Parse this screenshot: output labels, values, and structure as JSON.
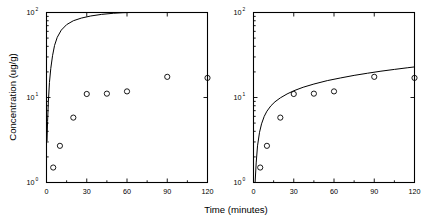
{
  "figure": {
    "background_color": "#ffffff",
    "ink_color": "#000000",
    "xlabel": "Time (minutes)",
    "ylabel": "Concentration (ug/g)"
  },
  "axes": {
    "x_ticks": [
      "0",
      "30",
      "60",
      "90",
      "120"
    ],
    "x_tick_values": [
      0,
      30,
      60,
      90,
      120
    ],
    "x_minor_values": [
      15,
      45,
      75,
      105
    ],
    "y_ticks": [
      "10",
      "10",
      "10"
    ],
    "y_tick_exponents": [
      "0",
      "1",
      "2"
    ],
    "y_tick_values": [
      1,
      10,
      100
    ],
    "xlim": [
      0,
      120
    ],
    "ylim": [
      1,
      100
    ],
    "yscale": "log",
    "xscale": "linear",
    "grid": false
  },
  "chart_data": [
    {
      "type": "scatter",
      "panel": "left",
      "title": "",
      "xlabel": "Time (minutes)",
      "ylabel": "Concentration (ug/g)",
      "xlim": [
        0,
        120
      ],
      "ylim": [
        1,
        100
      ],
      "yscale": "log",
      "grid": false,
      "legend": "none",
      "marker": "open-circle",
      "x": [
        5,
        10,
        20,
        30,
        45,
        60,
        90,
        120
      ],
      "y": [
        1.5,
        2.7,
        5.8,
        11.0,
        11.1,
        11.8,
        17.5,
        17.0
      ],
      "series": [
        {
          "name": "measured",
          "kind": "scatter",
          "x": [
            5,
            10,
            20,
            30,
            45,
            60,
            90,
            120
          ],
          "values": [
            1.5,
            2.7,
            5.8,
            11.0,
            11.1,
            11.8,
            17.5,
            17.0
          ]
        },
        {
          "name": "model-fit",
          "kind": "line",
          "note": "steep rise saturating at upper axis limit",
          "x": [
            0.4,
            0.8,
            1.4,
            2.2,
            3.2,
            4.5,
            6,
            8,
            11,
            15,
            20,
            26,
            33,
            41,
            50,
            57,
            62,
            70,
            85,
            100,
            120
          ],
          "values": [
            3.1,
            5.2,
            9.0,
            15.0,
            22.0,
            31.0,
            41.0,
            51.0,
            62.0,
            72.0,
            80.0,
            86.0,
            91.0,
            95.0,
            98.0,
            99.5,
            100.0,
            100.0,
            100.0,
            100.0,
            100.0
          ]
        }
      ]
    },
    {
      "type": "scatter",
      "panel": "right",
      "title": "",
      "xlabel": "Time (minutes)",
      "ylabel": "Concentration (ug/g)",
      "xlim": [
        0,
        120
      ],
      "ylim": [
        1,
        100
      ],
      "yscale": "log",
      "grid": false,
      "legend": "none",
      "marker": "open-circle",
      "x": [
        5,
        10,
        20,
        30,
        45,
        60,
        90,
        120
      ],
      "y": [
        1.5,
        2.7,
        5.8,
        11.0,
        11.1,
        11.8,
        17.5,
        17.0
      ],
      "series": [
        {
          "name": "measured",
          "kind": "scatter",
          "x": [
            5,
            10,
            20,
            30,
            45,
            60,
            90,
            120
          ],
          "values": [
            1.5,
            2.7,
            5.8,
            11.0,
            11.1,
            11.8,
            17.5,
            17.0
          ]
        },
        {
          "name": "model-fit",
          "kind": "line",
          "note": "good fit through data, rising to about 24 at 120 minutes",
          "x": [
            1.2,
            2,
            3,
            4.5,
            6,
            8,
            10,
            13,
            16,
            20,
            25,
            30,
            37,
            45,
            55,
            65,
            75,
            85,
            95,
            105,
            115,
            120
          ],
          "values": [
            1.0,
            1.7,
            2.7,
            3.9,
            4.9,
            6.0,
            6.9,
            8.0,
            8.9,
            9.9,
            11.0,
            12.0,
            13.2,
            14.4,
            15.8,
            17.0,
            18.2,
            19.3,
            20.4,
            21.4,
            22.4,
            22.9
          ]
        }
      ]
    }
  ]
}
